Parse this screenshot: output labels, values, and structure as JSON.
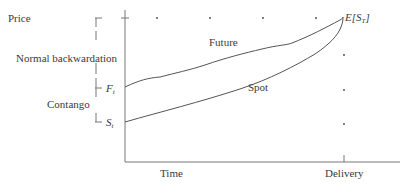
{
  "diagram": {
    "type": "futures-price-convergence",
    "y_axis_label": "Price",
    "x_axis_labels": {
      "start": "Time",
      "end": "Delivery"
    },
    "curves": [
      {
        "name": "Future",
        "label": "Future",
        "start_label": "F",
        "start_sub": "t"
      },
      {
        "name": "Spot",
        "label": "Spot",
        "start_label": "S",
        "start_sub": "t"
      }
    ],
    "endpoint_label": {
      "prefix": "E[S",
      "sub": "T",
      "suffix": "]"
    },
    "brackets": [
      {
        "name": "normal-backwardation",
        "label": "Normal backwardation"
      },
      {
        "name": "contango",
        "label": "Contango"
      }
    ],
    "colors": {
      "line": "#555555",
      "text": "#3a3a3a",
      "dots": "#444444"
    }
  }
}
